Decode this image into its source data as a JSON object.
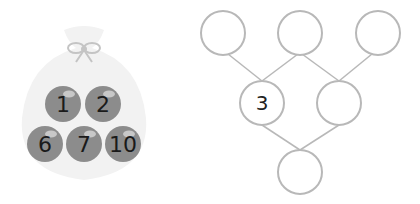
{
  "bag": {
    "balls": [
      {
        "label": "1",
        "cx": 63,
        "cy": 104
      },
      {
        "label": "2",
        "cx": 103,
        "cy": 104
      },
      {
        "label": "6",
        "cx": 45,
        "cy": 144
      },
      {
        "label": "7",
        "cx": 84,
        "cy": 144
      },
      {
        "label": "10",
        "cx": 123,
        "cy": 144
      }
    ],
    "colors": {
      "bag": "#f2f2f2",
      "ball": "#8c8c8c",
      "ribbon": "#c4c4c4"
    }
  },
  "tree": {
    "nodes": [
      {
        "id": "top-left",
        "label": "",
        "cx": 223,
        "cy": 33
      },
      {
        "id": "top-middle",
        "label": "",
        "cx": 300,
        "cy": 33
      },
      {
        "id": "top-right",
        "label": "",
        "cx": 378,
        "cy": 33
      },
      {
        "id": "middle-left",
        "label": "3",
        "cx": 262,
        "cy": 103
      },
      {
        "id": "middle-right",
        "label": "",
        "cx": 339,
        "cy": 103
      },
      {
        "id": "bottom",
        "label": "",
        "cx": 300,
        "cy": 172
      }
    ],
    "colors": {
      "stroke": "#b8b8b8"
    }
  }
}
